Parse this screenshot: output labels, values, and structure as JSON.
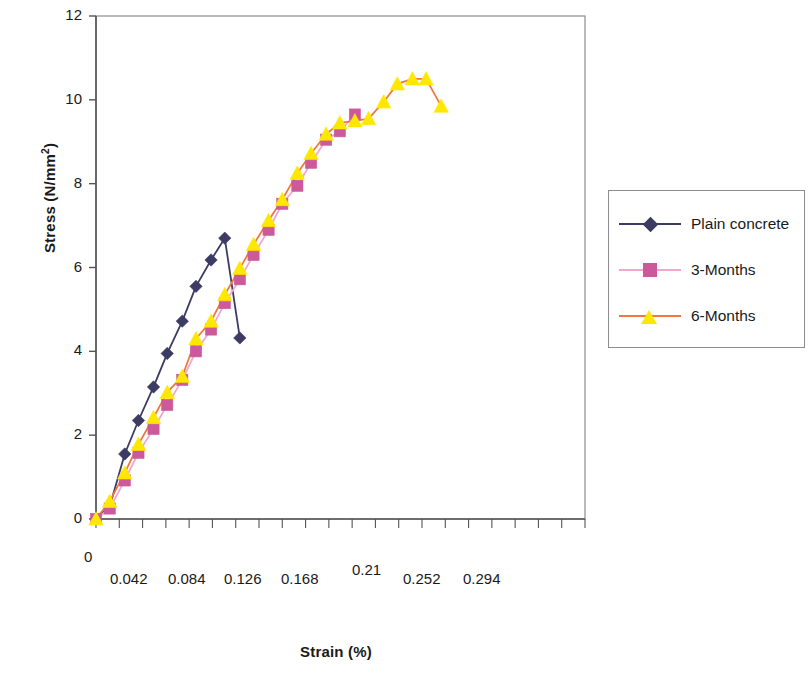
{
  "chart_data": {
    "type": "line",
    "title": "",
    "xlabel": "Strain (%)",
    "ylabel": "Stress (N/mm2)",
    "ylabel_base": "Stress (N/mm",
    "ylabel_sup": "2",
    "ylabel_close": ")",
    "xlim": [
      0,
      0.357
    ],
    "ylim": [
      0,
      12
    ],
    "grid": false,
    "legend_position": "right",
    "xtick_labels": [
      "0",
      "0.042",
      "0.084",
      "0.126",
      "0.168",
      "0.21",
      "0.252",
      "0.294"
    ],
    "xtick_values": [
      0,
      0.042,
      0.084,
      0.126,
      0.168,
      0.21,
      0.252,
      0.294
    ],
    "ytick_labels": [
      "0",
      "2",
      "4",
      "6",
      "8",
      "10",
      "12"
    ],
    "ytick_values": [
      0,
      2,
      4,
      6,
      8,
      10,
      12
    ],
    "minor_xticks": 21,
    "series": [
      {
        "name": "Plain concrete",
        "color": "#3b3b63",
        "marker": "diamond",
        "marker_color": "#3b3b63",
        "x": [
          0.0,
          0.01,
          0.021,
          0.031,
          0.042,
          0.052,
          0.063,
          0.073,
          0.084,
          0.094,
          0.105,
          0.115
        ],
        "y": [
          0.0,
          0.3,
          1.55,
          2.35,
          3.15,
          3.95,
          4.72,
          5.55,
          6.18,
          6.7,
          4.32,
          4.32
        ],
        "points": [
          {
            "x": 0.0,
            "y": 0.0
          },
          {
            "x": 0.01,
            "y": 0.3
          },
          {
            "x": 0.021,
            "y": 1.55
          },
          {
            "x": 0.031,
            "y": 2.35
          },
          {
            "x": 0.042,
            "y": 3.15
          },
          {
            "x": 0.052,
            "y": 3.95
          },
          {
            "x": 0.063,
            "y": 4.72
          },
          {
            "x": 0.073,
            "y": 5.55
          },
          {
            "x": 0.084,
            "y": 6.18
          },
          {
            "x": 0.094,
            "y": 6.7
          },
          {
            "x": 0.105,
            "y": 4.32
          }
        ]
      },
      {
        "name": "3-Months",
        "color": "#f0a8d0",
        "marker": "square",
        "marker_color": "#cc5a9b",
        "points": [
          {
            "x": 0.0,
            "y": 0.0
          },
          {
            "x": 0.01,
            "y": 0.25
          },
          {
            "x": 0.021,
            "y": 0.92
          },
          {
            "x": 0.031,
            "y": 1.58
          },
          {
            "x": 0.042,
            "y": 2.15
          },
          {
            "x": 0.052,
            "y": 2.72
          },
          {
            "x": 0.063,
            "y": 3.32
          },
          {
            "x": 0.073,
            "y": 4.0
          },
          {
            "x": 0.084,
            "y": 4.52
          },
          {
            "x": 0.094,
            "y": 5.15
          },
          {
            "x": 0.105,
            "y": 5.72
          },
          {
            "x": 0.115,
            "y": 6.3
          },
          {
            "x": 0.126,
            "y": 6.9
          },
          {
            "x": 0.136,
            "y": 7.52
          },
          {
            "x": 0.147,
            "y": 7.95
          },
          {
            "x": 0.157,
            "y": 8.5
          },
          {
            "x": 0.168,
            "y": 9.05
          },
          {
            "x": 0.178,
            "y": 9.25
          },
          {
            "x": 0.189,
            "y": 9.65
          }
        ]
      },
      {
        "name": "6-Months",
        "color": "#f07840",
        "marker": "triangle",
        "marker_color": "#ffe800",
        "points": [
          {
            "x": 0.0,
            "y": 0.0
          },
          {
            "x": 0.01,
            "y": 0.42
          },
          {
            "x": 0.021,
            "y": 1.1
          },
          {
            "x": 0.031,
            "y": 1.78
          },
          {
            "x": 0.042,
            "y": 2.42
          },
          {
            "x": 0.052,
            "y": 3.02
          },
          {
            "x": 0.063,
            "y": 3.4
          },
          {
            "x": 0.073,
            "y": 4.3
          },
          {
            "x": 0.084,
            "y": 4.72
          },
          {
            "x": 0.094,
            "y": 5.35
          },
          {
            "x": 0.105,
            "y": 5.98
          },
          {
            "x": 0.115,
            "y": 6.55
          },
          {
            "x": 0.126,
            "y": 7.12
          },
          {
            "x": 0.136,
            "y": 7.62
          },
          {
            "x": 0.147,
            "y": 8.25
          },
          {
            "x": 0.157,
            "y": 8.72
          },
          {
            "x": 0.168,
            "y": 9.18
          },
          {
            "x": 0.178,
            "y": 9.45
          },
          {
            "x": 0.189,
            "y": 9.5
          },
          {
            "x": 0.199,
            "y": 9.55
          },
          {
            "x": 0.21,
            "y": 9.95
          },
          {
            "x": 0.22,
            "y": 10.38
          },
          {
            "x": 0.231,
            "y": 10.5
          },
          {
            "x": 0.241,
            "y": 10.5
          },
          {
            "x": 0.252,
            "y": 9.85
          }
        ]
      }
    ]
  },
  "legend": {
    "items": [
      {
        "label": "Plain concrete",
        "color": "#3b3b63",
        "marker_color": "#3b3b63",
        "marker": "diamond"
      },
      {
        "label": "3-Months",
        "color": "#f0a8d0",
        "marker_color": "#cc5a9b",
        "marker": "square"
      },
      {
        "label": "6-Months",
        "color": "#f07840",
        "marker_color": "#ffe800",
        "marker": "triangle"
      }
    ]
  },
  "colors": {
    "axis": "#555555",
    "plot_border": "#8d8d8d",
    "plain_concrete": "#3b3b63",
    "three_months_line": "#f0a8d0",
    "three_months_marker": "#cc5a9b",
    "six_months_line": "#f07840",
    "six_months_marker": "#ffe800"
  }
}
